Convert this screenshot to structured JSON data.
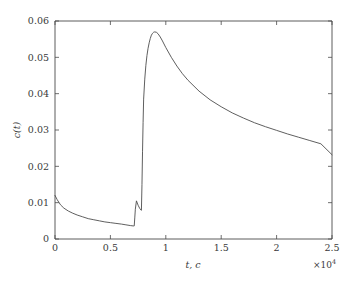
{
  "chart_data": {
    "type": "line",
    "title": "",
    "xlabel": "t, c",
    "ylabel": "c(t)",
    "x_exponent_label": "×10",
    "x_exponent_power": "4",
    "xlim": [
      0,
      2.5
    ],
    "ylim": [
      0,
      0.06
    ],
    "x_scale_factor": 10000,
    "grid": false,
    "legend": false,
    "xticks": [
      0,
      0.5,
      1,
      1.5,
      2,
      2.5
    ],
    "xtick_labels": [
      "0",
      "0.5",
      "1",
      "1.5",
      "2",
      "2.5"
    ],
    "yticks": [
      0,
      0.01,
      0.02,
      0.03,
      0.04,
      0.05,
      0.06
    ],
    "ytick_labels": [
      "0",
      "0.01",
      "0.02",
      "0.03",
      "0.04",
      "0.05",
      "0.06"
    ],
    "series": [
      {
        "name": "c(t)",
        "color": "#4d4d4d",
        "x": [
          0,
          0.02,
          0.05,
          0.08,
          0.12,
          0.16,
          0.2,
          0.25,
          0.3,
          0.35,
          0.4,
          0.45,
          0.5,
          0.55,
          0.6,
          0.64,
          0.68,
          0.705,
          0.715,
          0.72,
          0.725,
          0.735,
          0.75,
          0.765,
          0.775,
          0.78,
          0.785,
          0.79,
          0.795,
          0.8,
          0.81,
          0.82,
          0.83,
          0.84,
          0.85,
          0.86,
          0.87,
          0.88,
          0.89,
          0.9,
          0.915,
          0.93,
          0.95,
          0.97,
          1.0,
          1.05,
          1.1,
          1.15,
          1.2,
          1.3,
          1.4,
          1.5,
          1.6,
          1.7,
          1.8,
          1.9,
          2.0,
          2.1,
          2.2,
          2.3,
          2.4,
          2.5
        ],
        "y": [
          0.012,
          0.0108,
          0.0094,
          0.0085,
          0.0077,
          0.0071,
          0.0066,
          0.0061,
          0.0056,
          0.0053,
          0.005,
          0.0047,
          0.0045,
          0.0043,
          0.0041,
          0.0039,
          0.0037,
          0.0036,
          0.0036,
          0.0058,
          0.0082,
          0.0105,
          0.0093,
          0.0084,
          0.008,
          0.0079,
          0.015,
          0.024,
          0.032,
          0.0385,
          0.044,
          0.0478,
          0.0505,
          0.0525,
          0.054,
          0.0552,
          0.0561,
          0.0566,
          0.0569,
          0.057,
          0.0569,
          0.0565,
          0.0556,
          0.0545,
          0.0527,
          0.05,
          0.0476,
          0.0455,
          0.0437,
          0.0407,
          0.0383,
          0.0364,
          0.0347,
          0.0333,
          0.032,
          0.0309,
          0.0299,
          0.0289,
          0.028,
          0.0271,
          0.0262,
          0.0232
        ]
      }
    ]
  },
  "axes": {
    "y_axis_title": "c(t)",
    "x_axis_title": "t, c",
    "x_exponent": "×10",
    "x_exponent_power": "4"
  },
  "ticks": {
    "x": [
      "0",
      "0.5",
      "1",
      "1.5",
      "2",
      "2.5"
    ],
    "y": [
      "0",
      "0.01",
      "0.02",
      "0.03",
      "0.04",
      "0.05",
      "0.06"
    ]
  }
}
